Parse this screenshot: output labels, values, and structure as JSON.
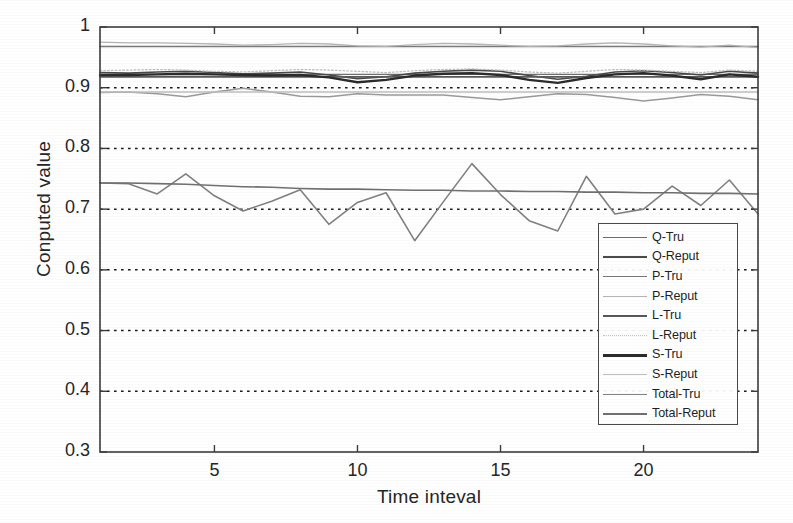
{
  "chart_data": {
    "type": "line",
    "title": "",
    "xlabel": "Time inteval",
    "ylabel": "Conputed value",
    "xlim": [
      1,
      24
    ],
    "ylim": [
      0.3,
      1.0
    ],
    "xticks": [
      5,
      10,
      15,
      20
    ],
    "xtick_labels": [
      "5",
      "10",
      "15",
      "20"
    ],
    "yticks": [
      0.3,
      0.4,
      0.5,
      0.6,
      0.7,
      0.8,
      0.9,
      1
    ],
    "ytick_labels": [
      "0.3",
      "0.4",
      "0.5",
      "0.6",
      "0.7",
      "0.8",
      "0.9",
      "1"
    ],
    "grid": "horizontal-dotted",
    "legend_position": "center-right",
    "x": [
      1,
      2,
      3,
      4,
      5,
      6,
      7,
      8,
      9,
      10,
      11,
      12,
      13,
      14,
      15,
      16,
      17,
      18,
      19,
      20,
      21,
      22,
      23,
      24
    ],
    "series": [
      {
        "name": "Q-Tru",
        "color": "#6e6e6e",
        "width": 1.4,
        "style": "solid",
        "values": [
          0.922,
          0.922,
          0.922,
          0.922,
          0.922,
          0.922,
          0.922,
          0.922,
          0.922,
          0.922,
          0.922,
          0.922,
          0.922,
          0.922,
          0.922,
          0.922,
          0.922,
          0.922,
          0.922,
          0.922,
          0.922,
          0.922,
          0.922,
          0.922
        ]
      },
      {
        "name": "Q-Reput",
        "color": "#4a4a4a",
        "width": 1.6,
        "style": "solid",
        "values": [
          0.925,
          0.924,
          0.926,
          0.927,
          0.925,
          0.923,
          0.924,
          0.926,
          0.921,
          0.915,
          0.918,
          0.924,
          0.927,
          0.929,
          0.927,
          0.92,
          0.914,
          0.919,
          0.926,
          0.928,
          0.925,
          0.921,
          0.927,
          0.924
        ]
      },
      {
        "name": "P-Tru",
        "color": "#7a7a7a",
        "width": 1.5,
        "style": "solid",
        "values": [
          0.968,
          0.968,
          0.968,
          0.968,
          0.968,
          0.968,
          0.968,
          0.968,
          0.968,
          0.968,
          0.968,
          0.968,
          0.968,
          0.968,
          0.968,
          0.968,
          0.968,
          0.968,
          0.968,
          0.968,
          0.968,
          0.968,
          0.968,
          0.968
        ]
      },
      {
        "name": "P-Reput",
        "color": "#b4b4b4",
        "width": 1.3,
        "style": "solid",
        "values": [
          0.975,
          0.974,
          0.974,
          0.973,
          0.972,
          0.97,
          0.971,
          0.973,
          0.972,
          0.969,
          0.968,
          0.971,
          0.973,
          0.972,
          0.97,
          0.968,
          0.969,
          0.972,
          0.974,
          0.972,
          0.969,
          0.967,
          0.97,
          0.966
        ]
      },
      {
        "name": "L-Tru",
        "color": "#585858",
        "width": 1.7,
        "style": "solid",
        "values": [
          0.918,
          0.918,
          0.918,
          0.918,
          0.918,
          0.918,
          0.918,
          0.918,
          0.918,
          0.918,
          0.918,
          0.918,
          0.918,
          0.918,
          0.918,
          0.918,
          0.918,
          0.918,
          0.918,
          0.918,
          0.918,
          0.918,
          0.918,
          0.918
        ]
      },
      {
        "name": "L-Reput",
        "color": "#c0c0c0",
        "width": 1.3,
        "style": "dotted",
        "values": [
          0.928,
          0.929,
          0.93,
          0.929,
          0.927,
          0.926,
          0.928,
          0.93,
          0.929,
          0.927,
          0.925,
          0.928,
          0.93,
          0.931,
          0.929,
          0.926,
          0.924,
          0.927,
          0.93,
          0.929,
          0.927,
          0.925,
          0.929,
          0.927
        ]
      },
      {
        "name": "S-Tru",
        "color": "#2b2b2b",
        "width": 2.4,
        "style": "solid",
        "values": [
          0.921,
          0.921,
          0.922,
          0.923,
          0.922,
          0.921,
          0.92,
          0.921,
          0.917,
          0.909,
          0.913,
          0.92,
          0.923,
          0.924,
          0.921,
          0.913,
          0.908,
          0.916,
          0.922,
          0.924,
          0.92,
          0.914,
          0.922,
          0.918
        ]
      },
      {
        "name": "S-Reput",
        "color": "#bdbdbd",
        "width": 1.4,
        "style": "solid",
        "values": [
          0.893,
          0.893,
          0.893,
          0.893,
          0.893,
          0.893,
          0.893,
          0.893,
          0.893,
          0.893,
          0.893,
          0.893,
          0.893,
          0.893,
          0.893,
          0.893,
          0.893,
          0.893,
          0.893,
          0.893,
          0.893,
          0.893,
          0.893,
          0.893
        ]
      },
      {
        "name": "Total-Tru",
        "color": "#808080",
        "width": 1.6,
        "style": "solid",
        "values": [
          0.743,
          0.742,
          0.725,
          0.758,
          0.722,
          0.697,
          0.713,
          0.732,
          0.675,
          0.711,
          0.727,
          0.648,
          0.712,
          0.775,
          0.724,
          0.681,
          0.664,
          0.754,
          0.692,
          0.7,
          0.738,
          0.706,
          0.748,
          0.692
        ]
      },
      {
        "name": "Total-Reput",
        "color": "#707070",
        "width": 1.6,
        "style": "solid",
        "values": [
          0.743,
          0.743,
          0.742,
          0.741,
          0.739,
          0.737,
          0.736,
          0.734,
          0.733,
          0.733,
          0.732,
          0.731,
          0.731,
          0.73,
          0.73,
          0.729,
          0.729,
          0.728,
          0.728,
          0.727,
          0.727,
          0.726,
          0.726,
          0.725
        ]
      }
    ],
    "secondary_wavy_band": [
      {
        "name": "upper-band-wave",
        "color": "#9a9a9a",
        "values": [
          0.892,
          0.893,
          0.89,
          0.885,
          0.893,
          0.899,
          0.893,
          0.886,
          0.885,
          0.89,
          0.888,
          0.888,
          0.888,
          0.884,
          0.88,
          0.885,
          0.89,
          0.889,
          0.884,
          0.878,
          0.883,
          0.889,
          0.886,
          0.88
        ]
      }
    ]
  },
  "axes": {
    "y_title": "Conputed value",
    "x_title": "Time inteval"
  },
  "legend": {
    "items": [
      {
        "label": "Q-Tru"
      },
      {
        "label": "Q-Reput"
      },
      {
        "label": "P-Tru"
      },
      {
        "label": "P-Reput"
      },
      {
        "label": "L-Tru"
      },
      {
        "label": "L-Reput"
      },
      {
        "label": "S-Tru"
      },
      {
        "label": "S-Reput"
      },
      {
        "label": "Total-Tru"
      },
      {
        "label": "Total-Reput"
      }
    ]
  }
}
